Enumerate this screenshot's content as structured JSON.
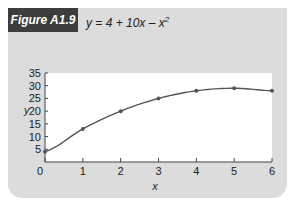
{
  "figure": {
    "label": "Figure A1.9",
    "equation_prefix": "y = 4 + 10x – x",
    "equation_exponent": "2"
  },
  "colors": {
    "panel": "#dcdcdc",
    "label_bg": "#3d3d3d",
    "line": "#555555",
    "plot_bg": "#ffffff"
  },
  "chart_data": {
    "type": "line",
    "xlabel": "x",
    "ylabel": "y",
    "x": [
      0,
      1,
      2,
      3,
      4,
      5,
      6
    ],
    "series": [
      {
        "name": "y = 4 + 10x – x²",
        "values": [
          4,
          13,
          20,
          25,
          28,
          29,
          28
        ]
      }
    ],
    "xlim": [
      0,
      6
    ],
    "ylim": [
      0,
      35
    ],
    "xticks": [
      "0",
      "1",
      "2",
      "3",
      "4",
      "5",
      "6"
    ],
    "yticks": [
      "5",
      "10",
      "15",
      "20",
      "25",
      "30",
      "35"
    ],
    "grid": false,
    "legend": "none",
    "markers": true
  }
}
